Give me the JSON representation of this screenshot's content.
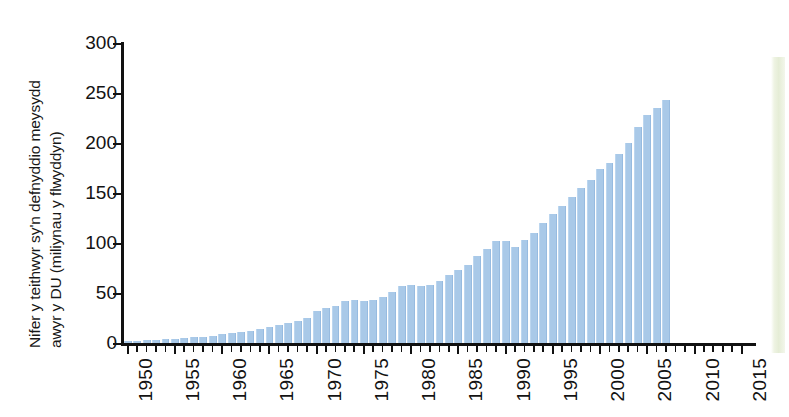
{
  "chart_data": {
    "type": "bar",
    "title": "",
    "subtitle": "",
    "xlabel": "",
    "ylabel": "Nifer y teithwyr sy'n defnyddio meysydd awyr y DU (miliynau y flwyddyn)",
    "ylabel_lines": [
      "Nifer y teithwyr sy'n defnyddio meysydd",
      "awyr y DU (miliynau y flwyddyn)"
    ],
    "ylim": [
      0,
      300
    ],
    "xlim": [
      1949.5,
      2016.5
    ],
    "ytick_values": [
      0,
      50,
      100,
      150,
      200,
      250,
      300
    ],
    "ytick_labels": [
      "0",
      "50",
      "100",
      "150",
      "200",
      "250",
      "300"
    ],
    "xtick_labels": [
      "1950",
      "1955",
      "1960",
      "1965",
      "1970",
      "1975",
      "1980",
      "1985",
      "1990",
      "1995",
      "2000",
      "2005",
      "2010",
      "2015"
    ],
    "xtick_values": [
      1950,
      1955,
      1960,
      1965,
      1970,
      1975,
      1980,
      1985,
      1990,
      1995,
      2000,
      2005,
      2010,
      2015
    ],
    "xtick_minor_step": 1,
    "grid": false,
    "legend": false,
    "bar_color": "#a9c9e8",
    "axis_color": "#111111",
    "categories": [
      1950,
      1951,
      1952,
      1953,
      1954,
      1955,
      1956,
      1957,
      1958,
      1959,
      1960,
      1961,
      1962,
      1963,
      1964,
      1965,
      1966,
      1967,
      1968,
      1969,
      1970,
      1971,
      1972,
      1973,
      1974,
      1975,
      1976,
      1977,
      1978,
      1979,
      1980,
      1981,
      1982,
      1983,
      1984,
      1985,
      1986,
      1987,
      1988,
      1989,
      1990,
      1991,
      1992,
      1993,
      1994,
      1995,
      1996,
      1997,
      1998,
      1999,
      2000,
      2001,
      2002,
      2003,
      2004,
      2005,
      2006,
      2007
    ],
    "values": [
      2,
      2,
      3,
      3,
      4,
      4,
      5,
      6,
      6,
      7,
      9,
      10,
      11,
      12,
      14,
      16,
      18,
      20,
      22,
      25,
      32,
      35,
      37,
      42,
      43,
      42,
      43,
      46,
      51,
      57,
      58,
      57,
      58,
      62,
      68,
      73,
      78,
      87,
      94,
      102,
      102,
      96,
      103,
      110,
      120,
      129,
      137,
      146,
      155,
      163,
      174,
      180,
      189,
      200,
      216,
      228,
      235,
      243
    ]
  }
}
